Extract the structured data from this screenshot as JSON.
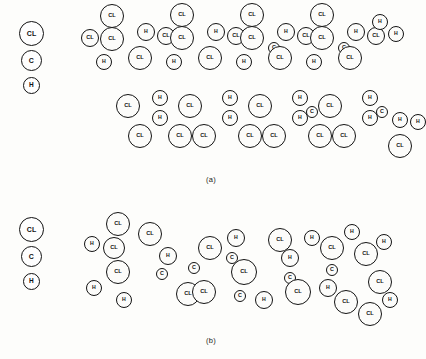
{
  "figure": {
    "background_color": "#fdfdfb",
    "outline_color": "#131313",
    "fill_color": "#fcfcfa",
    "legend": {
      "title": "",
      "items": [
        {
          "label": "CL",
          "name": "chlorine",
          "relative_size": "large"
        },
        {
          "label": "C",
          "name": "carbon",
          "relative_size": "medium"
        },
        {
          "label": "H",
          "name": "hydrogen",
          "relative_size": "small"
        }
      ]
    },
    "panels": [
      {
        "id": "a",
        "caption": "(a)",
        "description": "two stacked ordered polymer chains",
        "atoms": [
          {
            "label": "CL",
            "x": 28,
            "y": 16,
            "r": 12
          },
          {
            "label": "CL",
            "x": 6,
            "y": 38,
            "r": 9
          },
          {
            "label": "CL",
            "x": 28,
            "y": 39,
            "r": 12
          },
          {
            "label": "H",
            "x": 20,
            "y": 62,
            "r": 8
          },
          {
            "label": "H",
            "x": 62,
            "y": 32,
            "r": 9
          },
          {
            "label": "CL",
            "x": 56,
            "y": 58,
            "r": 12
          },
          {
            "label": "CL",
            "x": 82,
            "y": 36,
            "r": 9
          },
          {
            "label": "CL",
            "x": 98,
            "y": 15,
            "r": 12
          },
          {
            "label": "CL",
            "x": 98,
            "y": 38,
            "r": 12
          },
          {
            "label": "H",
            "x": 90,
            "y": 62,
            "r": 8
          },
          {
            "label": "H",
            "x": 132,
            "y": 32,
            "r": 9
          },
          {
            "label": "CL",
            "x": 126,
            "y": 58,
            "r": 12
          },
          {
            "label": "CL",
            "x": 152,
            "y": 36,
            "r": 9
          },
          {
            "label": "CL",
            "x": 168,
            "y": 15,
            "r": 12
          },
          {
            "label": "CL",
            "x": 168,
            "y": 38,
            "r": 12
          },
          {
            "label": "H",
            "x": 160,
            "y": 62,
            "r": 8
          },
          {
            "label": "C",
            "x": 190,
            "y": 48,
            "r": 6
          },
          {
            "label": "H",
            "x": 202,
            "y": 32,
            "r": 9
          },
          {
            "label": "CL",
            "x": 196,
            "y": 58,
            "r": 12
          },
          {
            "label": "CL",
            "x": 222,
            "y": 36,
            "r": 9
          },
          {
            "label": "CL",
            "x": 238,
            "y": 15,
            "r": 12
          },
          {
            "label": "CL",
            "x": 238,
            "y": 38,
            "r": 12
          },
          {
            "label": "H",
            "x": 230,
            "y": 62,
            "r": 8
          },
          {
            "label": "C",
            "x": 260,
            "y": 48,
            "r": 6
          },
          {
            "label": "H",
            "x": 272,
            "y": 32,
            "r": 9
          },
          {
            "label": "CL",
            "x": 266,
            "y": 58,
            "r": 12
          },
          {
            "label": "CL",
            "x": 292,
            "y": 36,
            "r": 9
          },
          {
            "label": "H",
            "x": 296,
            "y": 22,
            "r": 8
          },
          {
            "label": "H",
            "x": 312,
            "y": 34,
            "r": 8
          },
          {
            "label": "CL",
            "x": 44,
            "y": 106,
            "r": 12
          },
          {
            "label": "H",
            "x": 76,
            "y": 98,
            "r": 8
          },
          {
            "label": "H",
            "x": 76,
            "y": 118,
            "r": 8
          },
          {
            "label": "CL",
            "x": 56,
            "y": 136,
            "r": 12
          },
          {
            "label": "CL",
            "x": 106,
            "y": 106,
            "r": 12
          },
          {
            "label": "CL",
            "x": 96,
            "y": 136,
            "r": 12
          },
          {
            "label": "CL",
            "x": 120,
            "y": 136,
            "r": 12
          },
          {
            "label": "H",
            "x": 146,
            "y": 98,
            "r": 8
          },
          {
            "label": "H",
            "x": 146,
            "y": 118,
            "r": 8
          },
          {
            "label": "CL",
            "x": 176,
            "y": 106,
            "r": 12
          },
          {
            "label": "CL",
            "x": 166,
            "y": 136,
            "r": 12
          },
          {
            "label": "CL",
            "x": 190,
            "y": 136,
            "r": 12
          },
          {
            "label": "H",
            "x": 216,
            "y": 98,
            "r": 8
          },
          {
            "label": "C",
            "x": 228,
            "y": 112,
            "r": 6
          },
          {
            "label": "H",
            "x": 216,
            "y": 118,
            "r": 8
          },
          {
            "label": "CL",
            "x": 246,
            "y": 106,
            "r": 12
          },
          {
            "label": "CL",
            "x": 236,
            "y": 136,
            "r": 12
          },
          {
            "label": "CL",
            "x": 260,
            "y": 136,
            "r": 12
          },
          {
            "label": "H",
            "x": 286,
            "y": 98,
            "r": 8
          },
          {
            "label": "C",
            "x": 298,
            "y": 112,
            "r": 6
          },
          {
            "label": "H",
            "x": 286,
            "y": 118,
            "r": 8
          },
          {
            "label": "H",
            "x": 316,
            "y": 120,
            "r": 8
          },
          {
            "label": "H",
            "x": 334,
            "y": 122,
            "r": 8
          },
          {
            "label": "CL",
            "x": 316,
            "y": 146,
            "r": 12
          }
        ]
      },
      {
        "id": "b",
        "caption": "(b)",
        "description": "single thicker disordered polymer chain",
        "atoms": [
          {
            "label": "H",
            "x": 8,
            "y": 48,
            "r": 8
          },
          {
            "label": "CL",
            "x": 34,
            "y": 28,
            "r": 12
          },
          {
            "label": "CL",
            "x": 30,
            "y": 52,
            "r": 11
          },
          {
            "label": "CL",
            "x": 66,
            "y": 38,
            "r": 12
          },
          {
            "label": "CL",
            "x": 34,
            "y": 76,
            "r": 12
          },
          {
            "label": "H",
            "x": 10,
            "y": 92,
            "r": 8
          },
          {
            "label": "H",
            "x": 40,
            "y": 104,
            "r": 8
          },
          {
            "label": "H",
            "x": 84,
            "y": 60,
            "r": 9
          },
          {
            "label": "C",
            "x": 78,
            "y": 78,
            "r": 6
          },
          {
            "label": "CL",
            "x": 104,
            "y": 98,
            "r": 12
          },
          {
            "label": "C",
            "x": 110,
            "y": 72,
            "r": 6
          },
          {
            "label": "CL",
            "x": 126,
            "y": 52,
            "r": 12
          },
          {
            "label": "CL",
            "x": 120,
            "y": 96,
            "r": 12
          },
          {
            "label": "H",
            "x": 152,
            "y": 42,
            "r": 9
          },
          {
            "label": "C",
            "x": 148,
            "y": 62,
            "r": 6
          },
          {
            "label": "CL",
            "x": 160,
            "y": 76,
            "r": 13
          },
          {
            "label": "C",
            "x": 156,
            "y": 100,
            "r": 6
          },
          {
            "label": "H",
            "x": 180,
            "y": 104,
            "r": 9
          },
          {
            "label": "CL",
            "x": 196,
            "y": 44,
            "r": 12
          },
          {
            "label": "H",
            "x": 206,
            "y": 62,
            "r": 9
          },
          {
            "label": "C",
            "x": 206,
            "y": 82,
            "r": 6
          },
          {
            "label": "CL",
            "x": 214,
            "y": 96,
            "r": 13
          },
          {
            "label": "H",
            "x": 228,
            "y": 42,
            "r": 8
          },
          {
            "label": "CL",
            "x": 248,
            "y": 52,
            "r": 12
          },
          {
            "label": "C",
            "x": 248,
            "y": 74,
            "r": 6
          },
          {
            "label": "H",
            "x": 244,
            "y": 92,
            "r": 9
          },
          {
            "label": "CL",
            "x": 262,
            "y": 106,
            "r": 12
          },
          {
            "label": "H",
            "x": 268,
            "y": 36,
            "r": 8
          },
          {
            "label": "CL",
            "x": 282,
            "y": 58,
            "r": 12
          },
          {
            "label": "H",
            "x": 300,
            "y": 46,
            "r": 8
          },
          {
            "label": "CL",
            "x": 296,
            "y": 86,
            "r": 12
          },
          {
            "label": "H",
            "x": 306,
            "y": 104,
            "r": 8
          },
          {
            "label": "CL",
            "x": 286,
            "y": 118,
            "r": 12
          }
        ]
      }
    ]
  }
}
